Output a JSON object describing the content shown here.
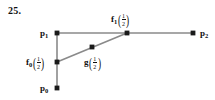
{
  "figure": {
    "exercise_number": "25.",
    "colors": {
      "line": "#8a8a8a",
      "point": "#1a1a1a",
      "text": "#101010",
      "background": "#ffffff"
    },
    "labels": {
      "p0": {
        "base": "p",
        "sub": "0"
      },
      "p1": {
        "base": "p",
        "sub": "1"
      },
      "p2": {
        "base": "p",
        "sub": "2"
      },
      "f0_half": {
        "base": "f",
        "sub": "0",
        "numerator": "1",
        "denominator": "2"
      },
      "f1_half": {
        "base": "f",
        "sub": "1",
        "numerator": "1",
        "denominator": "2"
      },
      "g_half": {
        "base": "g",
        "sub": "",
        "numerator": "1",
        "denominator": "2"
      }
    },
    "points": [
      {
        "name": "p1",
        "x": 57,
        "y": 33
      },
      {
        "name": "p2",
        "x": 193,
        "y": 33
      },
      {
        "name": "f1_half",
        "x": 127,
        "y": 33
      },
      {
        "name": "f0_half",
        "x": 57,
        "y": 62
      },
      {
        "name": "g_half",
        "x": 92,
        "y": 47
      },
      {
        "name": "p0",
        "x": 57,
        "y": 88
      }
    ],
    "segments": [
      {
        "name": "p1-to-p2",
        "x1": 57,
        "y1": 33,
        "x2": 193,
        "y2": 33
      },
      {
        "name": "p1-to-p0",
        "x1": 57,
        "y1": 33,
        "x2": 57,
        "y2": 88
      },
      {
        "name": "f0half-to-f1half",
        "x1": 57,
        "y1": 62,
        "x2": 127,
        "y2": 33
      }
    ]
  }
}
